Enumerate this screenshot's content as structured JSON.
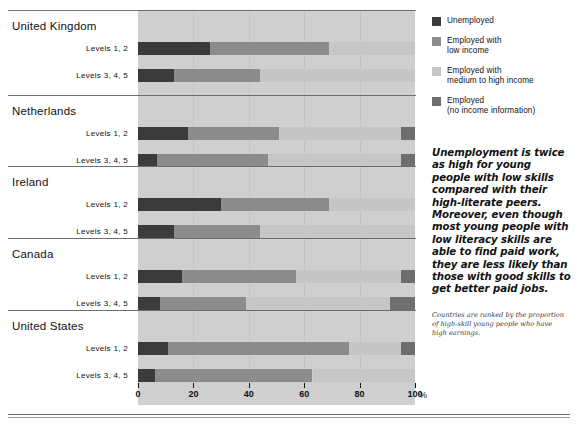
{
  "legend": {
    "items": [
      {
        "label": "Unemployed",
        "color": "#3b3b3b",
        "name": "unemployed"
      },
      {
        "label": "Employed with\nlow income",
        "color": "#8c8c8c",
        "name": "employed-low-income"
      },
      {
        "label": "Employed with\nmedium to high income",
        "color": "#c6c6c6",
        "name": "employed-medium-high-income"
      },
      {
        "label": "Employed\n(no income information)",
        "color": "#6e6e6e",
        "name": "employed-no-income-info"
      }
    ]
  },
  "pullquote": "Unemployment is twice as high for young people with low skills compared with their high-literate peers. Moreover, even though most young people with low literacy skills are able to find paid work, they are less likely than those with good skills to get better paid jobs.",
  "note": "Countries are ranked by the proportion of high-skill young people who have high earnings.",
  "axis": {
    "ticks": [
      0,
      20,
      40,
      60,
      80,
      100
    ],
    "unit": "%"
  },
  "chart_data": {
    "type": "bar",
    "title": "",
    "xlabel": "%",
    "ylabel": "",
    "xlim": [
      0,
      100
    ],
    "grid": false,
    "orientation": "horizontal",
    "stacked": true,
    "legend_position": "right",
    "series": [
      {
        "name": "Unemployed",
        "color": "#3b3b3b"
      },
      {
        "name": "Employed with low income",
        "color": "#8c8c8c"
      },
      {
        "name": "Employed with medium to high income",
        "color": "#c6c6c6"
      },
      {
        "name": "Employed (no income information)",
        "color": "#6e6e6e"
      }
    ],
    "groups": [
      {
        "country": "United Kingdom",
        "rows": [
          {
            "label": "Levels 1, 2",
            "values": [
              26,
              43,
              31,
              0
            ]
          },
          {
            "label": "Levels 3, 4, 5",
            "values": [
              13,
              31,
              56,
              0
            ]
          }
        ]
      },
      {
        "country": "Netherlands",
        "rows": [
          {
            "label": "Levels 1, 2",
            "values": [
              18,
              33,
              44,
              5
            ]
          },
          {
            "label": "Levels 3, 4, 5",
            "values": [
              7,
              40,
              48,
              5
            ]
          }
        ]
      },
      {
        "country": "Ireland",
        "rows": [
          {
            "label": "Levels 1, 2",
            "values": [
              30,
              39,
              31,
              0
            ]
          },
          {
            "label": "Levels 3, 4, 5",
            "values": [
              13,
              31,
              56,
              0
            ]
          }
        ]
      },
      {
        "country": "Canada",
        "rows": [
          {
            "label": "Levels 1, 2",
            "values": [
              16,
              41,
              38,
              5
            ]
          },
          {
            "label": "Levels 3, 4, 5",
            "values": [
              8,
              31,
              52,
              9
            ]
          }
        ]
      },
      {
        "country": "United States",
        "rows": [
          {
            "label": "Levels 1, 2",
            "values": [
              11,
              65,
              19,
              5
            ]
          },
          {
            "label": "Levels 3, 4, 5",
            "values": [
              6,
              57,
              37,
              0
            ]
          }
        ]
      }
    ]
  }
}
